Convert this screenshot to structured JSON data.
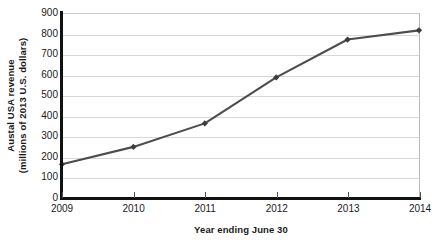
{
  "chart_data": {
    "type": "line",
    "title": "",
    "xlabel": "Year ending June 30",
    "ylabel": "Austal USA revenue (millions of 2013 U.S. dollars)",
    "ylabel_line1": "Austal USA revenue",
    "ylabel_line2": "(millions of 2013 U.S. dollars)",
    "x": [
      2009,
      2010,
      2011,
      2012,
      2013,
      2014
    ],
    "categories": [
      "2009",
      "2010",
      "2011",
      "2012",
      "2013",
      "2014"
    ],
    "values": [
      165,
      250,
      365,
      590,
      775,
      820
    ],
    "series": [
      {
        "name": "Austal USA revenue",
        "values": [
          165,
          250,
          365,
          590,
          775,
          820
        ]
      }
    ],
    "ylim": [
      0,
      900
    ],
    "ytick_step": 100,
    "yticks": [
      0,
      100,
      200,
      300,
      400,
      500,
      600,
      700,
      800,
      900
    ],
    "ytick_labels": [
      "0",
      "100",
      "200",
      "300",
      "400",
      "500",
      "600",
      "700",
      "800",
      "900"
    ],
    "xlim": [
      2009,
      2014
    ],
    "xticks": [
      2009,
      2010,
      2011,
      2012,
      2013,
      2014
    ],
    "xtick_labels": [
      "2009",
      "2010",
      "2011",
      "2012",
      "2013",
      "2014"
    ],
    "grid": "horizontal",
    "legend": "none",
    "marker": "diamond",
    "colors": {
      "line": "#4d4d4d",
      "marker": "#3d3d3d",
      "gridline": "#d7d7d7",
      "axis": "#111111",
      "text": "#1a1a1a",
      "background": "#ffffff",
      "plot_border": "#c9c9c9"
    }
  }
}
